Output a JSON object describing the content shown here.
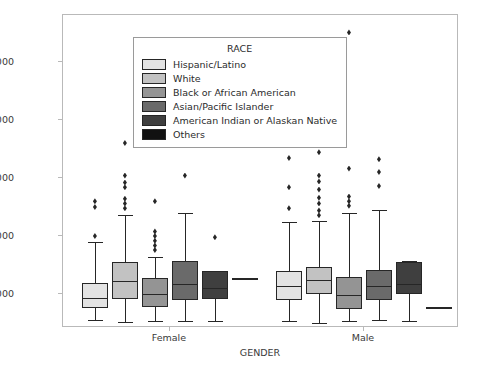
{
  "chart_data": {
    "type": "box",
    "title": "",
    "xlabel": "GENDER",
    "ylabel": "BASE_SALARY",
    "categories": [
      "Female",
      "Male"
    ],
    "ylim": [
      21000,
      290000
    ],
    "yticks": [
      50000,
      100000,
      150000,
      200000,
      250000
    ],
    "ytick_labels": [
      "50000",
      "100000",
      "150000",
      "200000",
      "250000"
    ],
    "grid": false,
    "legend": {
      "title": "RACE",
      "position": "upper left",
      "entries": [
        {
          "label": "Hispanic/Latino",
          "color": "#e3e3e3"
        },
        {
          "label": "White",
          "color": "#c2c2c2"
        },
        {
          "label": "Black or African American",
          "color": "#949494"
        },
        {
          "label": "Asian/Pacific Islander",
          "color": "#6a6a6a"
        },
        {
          "label": "American Indian or Alaskan Native",
          "color": "#3f3f3f"
        },
        {
          "label": "Others",
          "color": "#111111"
        }
      ]
    },
    "groups": [
      {
        "category": "Female",
        "boxes": [
          {
            "race": "Hispanic/Latino",
            "color": "#e3e3e3",
            "whisker_low": 28000,
            "q1": 38000,
            "median": 47000,
            "q3": 60000,
            "whisker_high": 95000,
            "outliers": [
              100000,
              125000,
              130000
            ]
          },
          {
            "race": "White",
            "color": "#c2c2c2",
            "whisker_low": 26000,
            "q1": 46000,
            "median": 61000,
            "q3": 78000,
            "whisker_high": 118000,
            "outliers": [
              124000,
              128000,
              132000,
              142000,
              146000,
              152000,
              180000
            ]
          },
          {
            "race": "Black or African American",
            "color": "#949494",
            "whisker_low": 27000,
            "q1": 39000,
            "median": 50000,
            "q3": 64000,
            "whisker_high": 82000,
            "outliers": [
              88000,
              92000,
              96000,
              100000,
              104000,
              130000
            ]
          },
          {
            "race": "Asian/Pacific Islander",
            "color": "#6a6a6a",
            "whisker_low": 27000,
            "q1": 45000,
            "median": 59000,
            "q3": 79000,
            "whisker_high": 120000,
            "outliers": [
              152000
            ]
          },
          {
            "race": "American Indian or Alaskan Native",
            "color": "#3f3f3f",
            "whisker_low": 27000,
            "q1": 46000,
            "median": 55000,
            "q3": 70000,
            "whisker_high": 70000,
            "outliers": [
              99000
            ]
          },
          {
            "race": "Others",
            "color": "#111111",
            "whisker_low": 63000,
            "q1": 63000,
            "median": 63000,
            "q3": 63000,
            "whisker_high": 63000,
            "outliers": []
          }
        ]
      },
      {
        "category": "Male",
        "boxes": [
          {
            "race": "Hispanic/Latino",
            "color": "#e3e3e3",
            "whisker_low": 27000,
            "q1": 45000,
            "median": 57000,
            "q3": 70000,
            "whisker_high": 112000,
            "outliers": [
              124000,
              142000,
              167000
            ]
          },
          {
            "race": "White",
            "color": "#c2c2c2",
            "whisker_low": 25000,
            "q1": 50000,
            "median": 62000,
            "q3": 73000,
            "whisker_high": 113000,
            "outliers": [
              118000,
              122000,
              128000,
              133000,
              140000,
              147000,
              152000,
              172000,
              183000,
              196000,
              205000
            ]
          },
          {
            "race": "Black or African American",
            "color": "#949494",
            "whisker_low": 27000,
            "q1": 37000,
            "median": 49000,
            "q3": 65000,
            "whisker_high": 120000,
            "outliers": [
              126000,
              130000,
              134000,
              158000,
              275000
            ]
          },
          {
            "race": "Asian/Pacific Islander",
            "color": "#6a6a6a",
            "whisker_low": 28000,
            "q1": 45000,
            "median": 57000,
            "q3": 71000,
            "whisker_high": 122000,
            "outliers": [
              143000,
              155000,
              166000
            ]
          },
          {
            "race": "American Indian or Alaskan Native",
            "color": "#3f3f3f",
            "whisker_low": 27000,
            "q1": 50000,
            "median": 59000,
            "q3": 78000,
            "whisker_high": 79000,
            "outliers": []
          },
          {
            "race": "Others",
            "color": "#111111",
            "whisker_low": 38000,
            "q1": 38000,
            "median": 38000,
            "q3": 38000,
            "whisker_high": 38000,
            "outliers": []
          }
        ]
      }
    ]
  }
}
